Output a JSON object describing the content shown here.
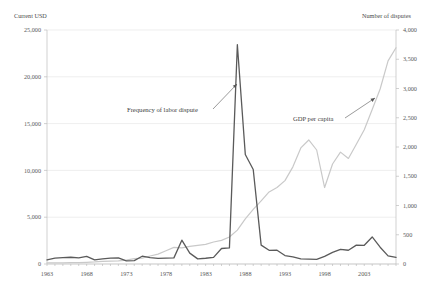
{
  "chart_data": {
    "type": "line",
    "title": "",
    "xlabel": "",
    "ylabel": "Current USD",
    "y2label": "Number of disputes",
    "grid": true,
    "legend_position": "inline-annotations",
    "x": [
      1963,
      1964,
      1965,
      1966,
      1967,
      1968,
      1969,
      1970,
      1971,
      1972,
      1973,
      1974,
      1975,
      1976,
      1977,
      1978,
      1979,
      1980,
      1981,
      1982,
      1983,
      1984,
      1985,
      1986,
      1987,
      1988,
      1989,
      1990,
      1991,
      1992,
      1993,
      1994,
      1995,
      1996,
      1997,
      1998,
      1999,
      2000,
      2001,
      2002,
      2003,
      2004,
      2005,
      2006,
      2007
    ],
    "xtick_labels": [
      "1963",
      "1968",
      "1973",
      "1978",
      "1983",
      "1988",
      "1993",
      "1998",
      "2003"
    ],
    "xtick_values": [
      1963,
      1968,
      1973,
      1978,
      1983,
      1988,
      1993,
      1998,
      2003
    ],
    "xlim": [
      1963,
      2007
    ],
    "ylim": [
      0,
      25000
    ],
    "ytick_labels": [
      "0",
      "5,000",
      "10,000",
      "15,000",
      "20,000",
      "25,000"
    ],
    "ytick_values": [
      0,
      5000,
      10000,
      15000,
      20000,
      25000
    ],
    "y2lim": [
      0,
      4000
    ],
    "y2tick_labels": [
      "0",
      "500",
      "1,000",
      "1,500",
      "2,000",
      "2,500",
      "3,000",
      "3,500",
      "4,000"
    ],
    "y2tick_values": [
      0,
      500,
      1000,
      1500,
      2000,
      2500,
      3000,
      3500,
      4000
    ],
    "series": [
      {
        "name": "GDP per capita",
        "axis": "left",
        "color": "#c9c9c9",
        "width": 1.2,
        "values": [
          110,
          120,
          130,
          140,
          150,
          180,
          220,
          280,
          310,
          340,
          410,
          580,
          630,
          850,
          1060,
          1410,
          1780,
          1720,
          1880,
          1990,
          2090,
          2350,
          2520,
          2880,
          3620,
          4830,
          5830,
          6750,
          7700,
          8180,
          8910,
          10380,
          12400,
          13250,
          12180,
          8170,
          10680,
          11950,
          11280,
          12790,
          14350,
          16500,
          18700,
          21700,
          23100
        ]
      },
      {
        "name": "Frequency of labor dispute",
        "axis": "right",
        "color": "#5a5a5a",
        "width": 1.3,
        "values": [
          70,
          100,
          110,
          115,
          105,
          130,
          70,
          88,
          101,
          105,
          55,
          58,
          133,
          110,
          96,
          102,
          105,
          407,
          186,
          88,
          98,
          113,
          265,
          276,
          3749,
          1873,
          1616,
          322,
          234,
          235,
          144,
          121,
          88,
          85,
          78,
          129,
          198,
          250,
          235,
          322,
          320,
          462,
          287,
          138,
          115
        ]
      }
    ],
    "annotations": [
      {
        "name": "frequency-annotation",
        "text": "Frequency of labor dispute",
        "text_x": 127,
        "text_y": 112,
        "line_x1": 213,
        "line_y1": 109,
        "line_x2": 237,
        "line_y2": 84
      },
      {
        "name": "gdp-annotation",
        "text": "GDP per capita",
        "text_x": 293,
        "text_y": 121,
        "line_x1": 345,
        "line_y1": 118,
        "line_x2": 375,
        "line_y2": 98
      }
    ]
  },
  "axes": {
    "left_title": "Current USD",
    "right_title": "Number of disputes"
  }
}
